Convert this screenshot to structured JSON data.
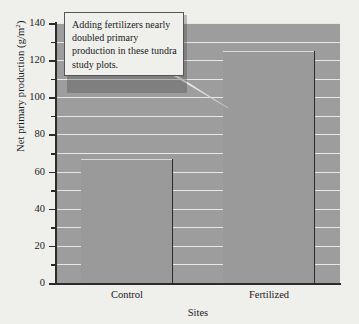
{
  "chart_data": {
    "type": "bar",
    "title": "",
    "subtitle": "",
    "xlabel": "Sites",
    "ylabel": "Net primary production (g/m2)",
    "ylabel_base": "Net primary production (g/m",
    "ylabel_sup": "2",
    "ylabel_tail": ")",
    "categories": [
      "Control",
      "Fertilized"
    ],
    "values": [
      67,
      125
    ],
    "ylim": [
      0,
      140
    ],
    "ytick_major": [
      0,
      20,
      40,
      60,
      80,
      100,
      120,
      140
    ],
    "ytick_minor": [
      10,
      30,
      50,
      70,
      90,
      110,
      130
    ],
    "gridlines": [
      10,
      20,
      30,
      40,
      50,
      60,
      70,
      80,
      90,
      100,
      110,
      120,
      130,
      140
    ],
    "grid": true,
    "legend": "none",
    "annotations": [
      {
        "text": "Adding fertilizers nearly doubled primary production in these tundra study plots.",
        "points_to": "Fertilized"
      }
    ],
    "colors": {
      "figure_background": "#efefec",
      "plot_background": "#9d9d9d",
      "bar_fill": "#9a9a9a",
      "gridline": "#e8e8e6",
      "axis": "#2b2b2b",
      "callout_background": "#efefec",
      "callout_border": "#56565a",
      "text": "#1a1a1a"
    }
  },
  "callout": {
    "text": "Adding fertilizers nearly doubled primary production in these tundra study plots."
  }
}
